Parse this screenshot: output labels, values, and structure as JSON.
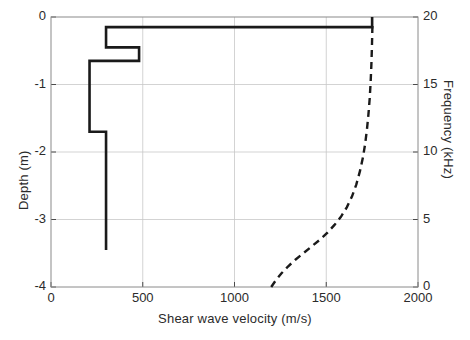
{
  "chart_data": {
    "type": "line",
    "title": "",
    "xlabel": "Shear wave velocity (m/s)",
    "ylabel": "Depth (m)",
    "ylabel_right": "Frequency (kHz)",
    "xlim": [
      0,
      2000
    ],
    "ylim": [
      -4,
      0
    ],
    "ylim_right": [
      0,
      20
    ],
    "xticks": [
      0,
      500,
      1000,
      1500,
      2000
    ],
    "xticklabels": [
      "0",
      "500",
      "1000",
      "1500",
      "2000"
    ],
    "yticks": [
      0,
      -1,
      -2,
      -3,
      -4
    ],
    "yticklabels": [
      "0",
      "-1",
      "-2",
      "-3",
      "-4"
    ],
    "yticks_right": [
      0,
      5,
      10,
      15,
      20
    ],
    "yticklabels_right": [
      "0",
      "5",
      "10",
      "15",
      "20"
    ],
    "grid": true,
    "legend": "none",
    "series": [
      {
        "name": "Shear wave velocity profile",
        "style": "solid",
        "color": "#1a1a1a",
        "linewidth": 2.6,
        "axis": "left",
        "comment": "step (layered) profile: velocity (m/s) vs depth (m)",
        "layers": [
          {
            "velocity": 1750,
            "top": 0.0,
            "bottom": -0.15
          },
          {
            "velocity": 300,
            "top": -0.15,
            "bottom": -0.45
          },
          {
            "velocity": 480,
            "top": -0.45,
            "bottom": -0.65
          },
          {
            "velocity": 210,
            "top": -0.65,
            "bottom": -1.7
          },
          {
            "velocity": 300,
            "top": -1.7,
            "bottom": -3.45
          }
        ],
        "points": [
          [
            1750,
            0.0
          ],
          [
            1750,
            -0.15
          ],
          [
            300,
            -0.15
          ],
          [
            300,
            -0.45
          ],
          [
            480,
            -0.45
          ],
          [
            480,
            -0.65
          ],
          [
            210,
            -0.65
          ],
          [
            210,
            -1.7
          ],
          [
            300,
            -1.7
          ],
          [
            300,
            -3.45
          ]
        ]
      },
      {
        "name": "Dispersion curve",
        "style": "dashed",
        "color": "#1a1a1a",
        "linewidth": 2.4,
        "axis": "right",
        "comment": "phase velocity (m/s) vs frequency (kHz)",
        "points": [
          [
            1200,
            0.0
          ],
          [
            1225,
            0.5
          ],
          [
            1255,
            1.0
          ],
          [
            1290,
            1.5
          ],
          [
            1330,
            2.0
          ],
          [
            1375,
            2.5
          ],
          [
            1420,
            3.0
          ],
          [
            1465,
            3.5
          ],
          [
            1505,
            4.0
          ],
          [
            1545,
            4.6
          ],
          [
            1580,
            5.2
          ],
          [
            1612,
            5.9
          ],
          [
            1640,
            6.7
          ],
          [
            1664,
            7.6
          ],
          [
            1684,
            8.6
          ],
          [
            1700,
            9.6
          ],
          [
            1712,
            10.6
          ],
          [
            1722,
            11.7
          ],
          [
            1730,
            12.8
          ],
          [
            1737,
            14.0
          ],
          [
            1742,
            15.2
          ],
          [
            1746,
            16.5
          ],
          [
            1749,
            17.8
          ],
          [
            1751,
            19.0
          ],
          [
            1752,
            19.5
          ]
        ]
      }
    ]
  },
  "axes": {
    "x_title": "Shear wave velocity (m/s)",
    "y_title_left": "Depth (m)",
    "y_title_right": "Frequency (kHz)"
  },
  "colors": {
    "line": "#1a1a1a",
    "grid": "#c8c8c8",
    "axis": "#4a4a4a",
    "background": "#ffffff"
  }
}
